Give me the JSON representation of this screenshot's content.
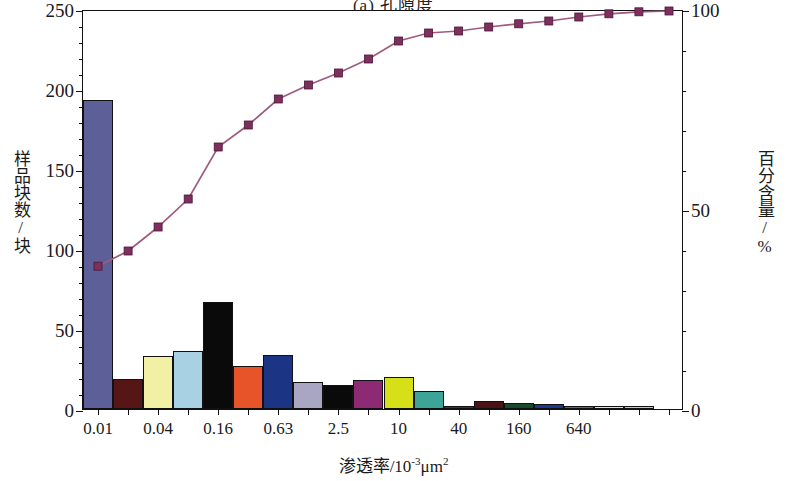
{
  "title": "(a) 孔隙度",
  "axes": {
    "y_left_title": "样品块数/块",
    "y_right_title": "百分含量/%",
    "x_title_main": "渗透率/10",
    "x_title_exp": "-3",
    "x_title_unit": "μm",
    "x_title_unit_exp": "2",
    "y_left_ticks": [
      "0",
      "50",
      "100",
      "150",
      "200",
      "250"
    ],
    "y_right_ticks": [
      "0",
      "50",
      "100"
    ],
    "x_ticks": [
      "0.01",
      "0.04",
      "0.16",
      "0.63",
      "2.5",
      "10",
      "40",
      "160",
      "640"
    ]
  },
  "chart_data": {
    "type": "bar",
    "title": "(a) 孔隙度",
    "xlabel": "渗透率/10-3μm2",
    "ylabel": "样品块数/块",
    "y2label": "百分含量/%",
    "ylim": [
      0,
      250
    ],
    "y2lim": [
      0,
      100
    ],
    "grid": false,
    "legend": "none",
    "categories": [
      "0.01",
      "",
      "0.04",
      "",
      "0.16",
      "",
      "0.63",
      "",
      "2.5",
      "",
      "10",
      "",
      "40",
      "",
      "160",
      "",
      "640",
      "",
      "",
      ""
    ],
    "tick_label_positions": [
      0,
      2,
      4,
      6,
      8,
      10,
      12,
      14,
      16
    ],
    "bars": [
      {
        "index": 0,
        "value": 193,
        "color": "#5d5f98"
      },
      {
        "index": 1,
        "value": 19,
        "color": "#561616"
      },
      {
        "index": 2,
        "value": 33,
        "color": "#f2f0a4"
      },
      {
        "index": 3,
        "value": 36,
        "color": "#a8d2e4"
      },
      {
        "index": 4,
        "value": 67,
        "color": "#0a0a0a"
      },
      {
        "index": 5,
        "value": 27,
        "color": "#e8542a"
      },
      {
        "index": 6,
        "value": 34,
        "color": "#1c3484"
      },
      {
        "index": 7,
        "value": 17,
        "color": "#a8a6c2"
      },
      {
        "index": 8,
        "value": 15,
        "color": "#0a0a0a"
      },
      {
        "index": 9,
        "value": 18,
        "color": "#8e2a73"
      },
      {
        "index": 10,
        "value": 20,
        "color": "#d6e018"
      },
      {
        "index": 11,
        "value": 11,
        "color": "#3da598"
      },
      {
        "index": 12,
        "value": 2,
        "color": "#1d3f66"
      },
      {
        "index": 13,
        "value": 5,
        "color": "#4a1414"
      },
      {
        "index": 14,
        "value": 4,
        "color": "#17492c"
      },
      {
        "index": 15,
        "value": 3,
        "color": "#1b3a8c"
      },
      {
        "index": 16,
        "value": 2,
        "color": "#1380c0"
      },
      {
        "index": 17,
        "value": 2,
        "color": "#cfe6ef"
      },
      {
        "index": 18,
        "value": 2,
        "color": "#9fd4e8"
      },
      {
        "index": 19,
        "value": 0,
        "color": "#ffffff"
      }
    ],
    "cumulative_series": {
      "name": "百分含量/%",
      "marker": "square",
      "color": "#7d2f5e",
      "line_color": "#a05a7d",
      "values": [
        36.2,
        40.0,
        46.0,
        53.0,
        66.0,
        71.5,
        78.0,
        81.5,
        84.5,
        88.0,
        92.5,
        94.5,
        95.0,
        96.0,
        96.8,
        97.5,
        98.5,
        99.3,
        99.8,
        100.0
      ]
    }
  }
}
